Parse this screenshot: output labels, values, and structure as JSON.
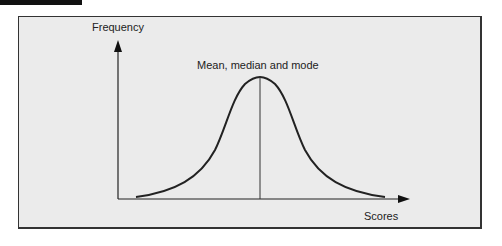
{
  "figure": {
    "y_axis_label": "Frequency",
    "x_axis_label": "Scores",
    "annotation": "Mean, median and mode",
    "curve": "normal distribution (bell curve)",
    "colors": {
      "background": "#ebebeb",
      "line": "#222222",
      "frame": "#333333",
      "header_bar": "#111111"
    }
  }
}
